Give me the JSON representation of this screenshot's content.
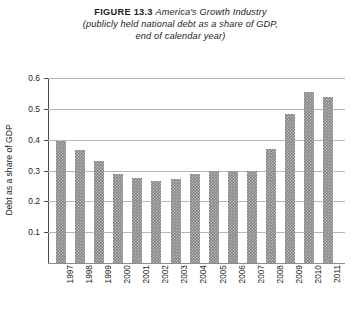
{
  "title": {
    "figure_label": "FIGURE 13.3",
    "main": "America's Growth Industry",
    "subtitle_line1": "(publicly held national debt as a share of GDP,",
    "subtitle_line2": "end of calendar year)"
  },
  "chart_data": {
    "type": "bar",
    "title": "FIGURE 13.3 America's Growth Industry",
    "subtitle": "(publicly held national debt as a share of GDP, end of calendar year)",
    "xlabel": "",
    "ylabel": "Debt as a share of GDP",
    "ylim": [
      0,
      0.6
    ],
    "ytick_labels": [
      "0.6",
      "0.5",
      "0.4",
      "0.3",
      "0.2",
      "0.1"
    ],
    "ytick_values": [
      0.6,
      0.5,
      0.4,
      0.3,
      0.2,
      0.1
    ],
    "grid": true,
    "legend": null,
    "bar_color": "#848484",
    "categories": [
      "1997",
      "1998",
      "1999",
      "2000",
      "2001",
      "2002",
      "2003",
      "2004",
      "2005",
      "2006",
      "2007",
      "2008",
      "2009",
      "2010",
      "2011"
    ],
    "values": [
      0.395,
      0.365,
      0.33,
      0.288,
      0.275,
      0.265,
      0.272,
      0.29,
      0.3,
      0.3,
      0.3,
      0.37,
      0.483,
      0.555,
      0.54
    ]
  }
}
